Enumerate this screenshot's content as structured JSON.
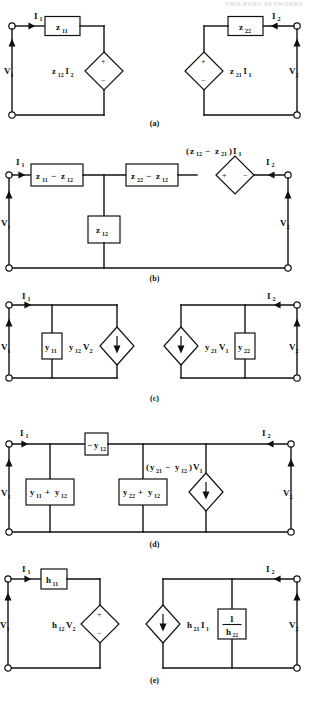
{
  "header": {
    "running_head": "TWO-PORT NETWORKS"
  },
  "figure": {
    "panels": [
      {
        "id": "a",
        "caption": "(a)",
        "model": "z-parameter equivalent circuit",
        "labels": {
          "i1": "I",
          "i1_sub": "1",
          "i2": "I",
          "i2_sub": "2",
          "v1": "V",
          "v1_sub": "1",
          "v2": "V",
          "v2_sub": "2",
          "box_left": "z",
          "box_left_sub": "11",
          "box_right": "z",
          "box_right_sub": "22",
          "src_left": "z",
          "src_left_sub": "12",
          "src_left_i": "I",
          "src_left_i_sub": "2",
          "src_right": "z",
          "src_right_sub": "21",
          "src_right_i": "I",
          "src_right_i_sub": "1",
          "plus": "+",
          "minus": "−"
        }
      },
      {
        "id": "b",
        "caption": "(b)",
        "model": "z-parameter T equivalent circuit",
        "labels": {
          "i1": "I",
          "i1_sub": "1",
          "i2": "I",
          "i2_sub": "2",
          "v1": "V",
          "v1_sub": "1",
          "v2": "V",
          "v2_sub": "2",
          "box1": "z",
          "box1_sub1": "11",
          "box1_op": "−",
          "box1_sub2": "12",
          "box1_b": "z",
          "box2": "z",
          "box2_sub1": "22",
          "box2_op": "−",
          "box2_sub2": "12",
          "box2_b": "z",
          "box3": "z",
          "box3_sub": "12",
          "src_open": "(",
          "src_a": "z",
          "src_a_sub": "12",
          "src_op": "−",
          "src_b": "z",
          "src_b_sub": "21",
          "src_close": ")",
          "src_i": "I",
          "src_i_sub": "1",
          "plus": "+",
          "minus": "−"
        }
      },
      {
        "id": "c",
        "caption": "(c)",
        "model": "y-parameter equivalent circuit",
        "labels": {
          "i1": "I",
          "i1_sub": "1",
          "i2": "I",
          "i2_sub": "2",
          "v1": "V",
          "v1_sub": "1",
          "v2": "V",
          "v2_sub": "2",
          "box_left": "y",
          "box_left_sub": "11",
          "box_right": "y",
          "box_right_sub": "22",
          "src_left": "y",
          "src_left_sub": "12",
          "src_left_v": "V",
          "src_left_v_sub": "2",
          "src_right": "y",
          "src_right_sub": "21",
          "src_right_v": "V",
          "src_right_v_sub": "1"
        }
      },
      {
        "id": "d",
        "caption": "(d)",
        "model": "y-parameter Pi equivalent circuit",
        "labels": {
          "i1": "I",
          "i1_sub": "1",
          "i2": "I",
          "i2_sub": "2",
          "v1": "V",
          "v1_sub": "1",
          "v2": "V",
          "v2_sub": "2",
          "series_op": "−",
          "series": "y",
          "series_sub": "12",
          "shunt1_a": "y",
          "shunt1_a_sub": "11",
          "shunt1_op": "+",
          "shunt1_b": "y",
          "shunt1_b_sub": "12",
          "shunt2_a": "y",
          "shunt2_a_sub": "22",
          "shunt2_op": "+",
          "shunt2_b": "y",
          "shunt2_b_sub": "12",
          "src_open": "(",
          "src_a": "y",
          "src_a_sub": "21",
          "src_op": "−",
          "src_b": "y",
          "src_b_sub": "12",
          "src_close": ")",
          "src_v": "V",
          "src_v_sub": "1"
        }
      },
      {
        "id": "e",
        "caption": "(e)",
        "model": "h-parameter equivalent circuit",
        "labels": {
          "i1": "I",
          "i1_sub": "1",
          "i2": "I",
          "i2_sub": "2",
          "v1": "V",
          "v1_sub": "1",
          "v2": "V",
          "v2_sub": "2",
          "box_left": "h",
          "box_left_sub": "11",
          "src_left": "h",
          "src_left_sub": "12",
          "src_left_v": "V",
          "src_left_v_sub": "2",
          "src_right": "h",
          "src_right_sub": "21",
          "src_right_i": "I",
          "src_right_i_sub": "1",
          "frac_num": "1",
          "frac_den": "h",
          "frac_den_sub": "22",
          "plus": "+",
          "minus": "−"
        }
      }
    ]
  },
  "colors": {
    "ink": "#111111",
    "paper": "#ffffff",
    "header_grey": "#d8d8d8"
  }
}
